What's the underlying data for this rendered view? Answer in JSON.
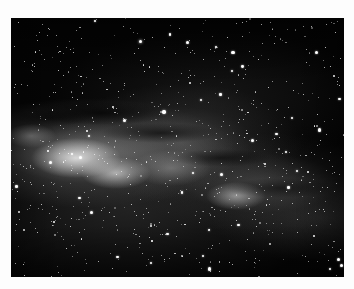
{
  "image": {
    "subject": "Milky Way galactic band in a dense star field",
    "style": "black-and-white astrophotograph",
    "background_color": "#fdfdfd",
    "photo_bg_color": "#050505",
    "frame": {
      "left": 11,
      "top": 18,
      "width": 333,
      "height": 259
    },
    "star_count": 900,
    "bright_star_count": 40
  }
}
